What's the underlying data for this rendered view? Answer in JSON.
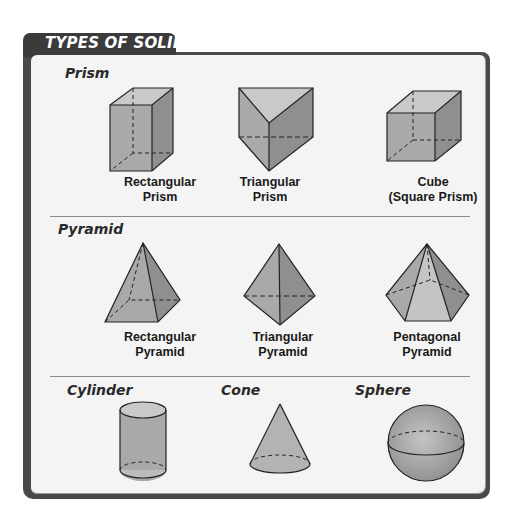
{
  "header": {
    "title": "TYPES OF SOLIDS"
  },
  "sections": [
    {
      "title": "Prism",
      "items": [
        {
          "name": "rectangular-prism",
          "line1": "Rectangular",
          "line2": "Prism"
        },
        {
          "name": "triangular-prism",
          "line1": "Triangular",
          "line2": "Prism"
        },
        {
          "name": "cube",
          "line1": "Cube",
          "line2": "(Square Prism)"
        }
      ]
    },
    {
      "title": "Pyramid",
      "items": [
        {
          "name": "rectangular-pyramid",
          "line1": "Rectangular",
          "line2": "Pyramid"
        },
        {
          "name": "triangular-pyramid",
          "line1": "Triangular",
          "line2": "Pyramid"
        },
        {
          "name": "pentagonal-pyramid",
          "line1": "Pentagonal",
          "line2": "Pyramid"
        }
      ]
    },
    {
      "items": [
        {
          "name": "cylinder",
          "title": "Cylinder"
        },
        {
          "name": "cone",
          "title": "Cone"
        },
        {
          "name": "sphere",
          "title": "Sphere"
        }
      ]
    }
  ],
  "colors": {
    "frame": "#4a4a4a",
    "tab": "#3b3b3b",
    "panel": "#f4f4f4",
    "shape_light": "#c8c8c8",
    "shape_mid": "#ababab",
    "shape_dark": "#8e8e8e",
    "outline": "#222222"
  }
}
